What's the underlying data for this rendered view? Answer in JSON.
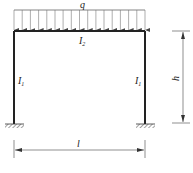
{
  "diagram": {
    "load_label": "q",
    "beam_label": "I",
    "beam_sub": "2",
    "left_column_label": "I",
    "left_column_sub": "1",
    "right_column_label": "I",
    "right_column_sub": "1",
    "height_label": "h",
    "span_label": "l",
    "colors": {
      "line": "#222222",
      "arrow": "#555555"
    }
  }
}
